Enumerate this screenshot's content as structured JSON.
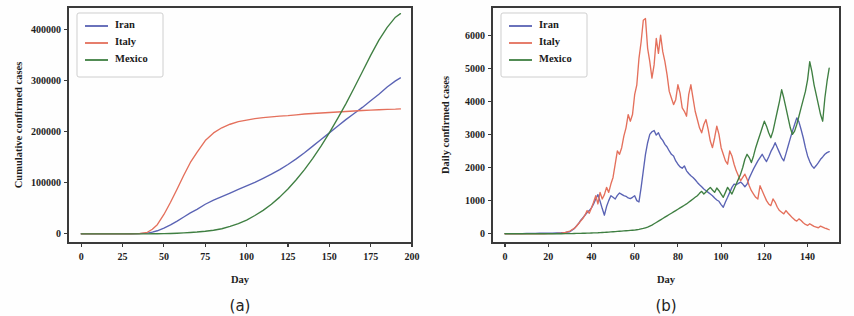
{
  "figure": {
    "background": "#fefefe",
    "panels": [
      {
        "id": "a",
        "caption": "(a)",
        "chart_index": 0
      },
      {
        "id": "b",
        "caption": "(b)",
        "chart_index": 1
      }
    ]
  },
  "colors": {
    "iran": "#5a63b4",
    "italy": "#e4705c",
    "mexico": "#3f7f42",
    "axis": "#3a3a3a",
    "text": "#1d1d1d"
  },
  "chart_data": [
    {
      "type": "line",
      "title": "",
      "panel_label": "(a)",
      "xlabel": "Day",
      "ylabel": "Cumulative confirmed cases",
      "xlim": [
        -8,
        200
      ],
      "ylim": [
        -18000,
        445000
      ],
      "xticks": [
        0,
        25,
        50,
        75,
        100,
        125,
        150,
        175,
        200
      ],
      "xtick_labels": [
        "0",
        "25",
        "50",
        "75",
        "100",
        "125",
        "150",
        "175",
        "200"
      ],
      "yticks": [
        0,
        100000,
        200000,
        300000,
        400000
      ],
      "ytick_labels": [
        "0",
        "100000",
        "200000",
        "300000",
        "400000"
      ],
      "grid": false,
      "legend_position": "upper left",
      "legend_entries": [
        "Iran",
        "Italy",
        "Mexico"
      ],
      "x": [
        0,
        5,
        10,
        15,
        20,
        25,
        30,
        35,
        40,
        43,
        46,
        50,
        54,
        58,
        62,
        66,
        70,
        75,
        80,
        85,
        90,
        95,
        100,
        105,
        110,
        115,
        120,
        125,
        130,
        135,
        140,
        145,
        150,
        155,
        160,
        165,
        170,
        175,
        180,
        185,
        190,
        193
      ],
      "series": [
        {
          "name": "Iran",
          "color": "#5a63b4",
          "values": [
            0,
            0,
            0,
            0,
            0,
            0,
            100,
            300,
            1500,
            3500,
            6000,
            11000,
            17500,
            25000,
            33000,
            41000,
            48000,
            58000,
            66000,
            73000,
            80000,
            87000,
            94000,
            101000,
            109000,
            117000,
            126000,
            136000,
            147000,
            159000,
            172000,
            185000,
            198000,
            211000,
            224000,
            236000,
            248000,
            261000,
            274000,
            288000,
            300000,
            306000
          ]
        },
        {
          "name": "Italy",
          "color": "#e4705c",
          "values": [
            0,
            0,
            0,
            0,
            0,
            0,
            50,
            400,
            3000,
            9000,
            18000,
            38000,
            62000,
            88000,
            115000,
            140000,
            160000,
            183000,
            198000,
            208000,
            215000,
            220000,
            223000,
            226000,
            228000,
            229500,
            231000,
            232000,
            233500,
            235000,
            236000,
            237000,
            238000,
            239000,
            240000,
            241000,
            242000,
            242800,
            243500,
            244000,
            244500,
            245000
          ]
        },
        {
          "name": "Mexico",
          "color": "#3f7f42",
          "values": [
            0,
            0,
            0,
            0,
            0,
            0,
            0,
            0,
            50,
            100,
            200,
            400,
            700,
            1200,
            1800,
            2600,
            3500,
            5000,
            7000,
            10000,
            14500,
            20000,
            27000,
            36000,
            46000,
            58000,
            72000,
            88000,
            106000,
            126000,
            148000,
            172000,
            198000,
            226000,
            255000,
            286000,
            318000,
            350000,
            380000,
            405000,
            425000,
            432000
          ]
        }
      ]
    },
    {
      "type": "line",
      "title": "",
      "panel_label": "(b)",
      "xlabel": "Day",
      "ylabel": "Daily confirmed cases",
      "xlim": [
        -6,
        155
      ],
      "ylim": [
        -280,
        6850
      ],
      "xticks": [
        0,
        20,
        40,
        60,
        80,
        100,
        120,
        140
      ],
      "xtick_labels": [
        "0",
        "20",
        "40",
        "60",
        "80",
        "100",
        "120",
        "140"
      ],
      "yticks": [
        0,
        1000,
        2000,
        3000,
        4000,
        5000,
        6000
      ],
      "ytick_labels": [
        "0",
        "1000",
        "2000",
        "3000",
        "4000",
        "5000",
        "6000"
      ],
      "grid": false,
      "legend_position": "upper left",
      "legend_entries": [
        "Iran",
        "Italy",
        "Mexico"
      ],
      "x": [
        0,
        2,
        4,
        6,
        8,
        10,
        12,
        14,
        16,
        18,
        20,
        22,
        24,
        26,
        28,
        30,
        31,
        32,
        33,
        34,
        35,
        36,
        37,
        38,
        39,
        40,
        41,
        42,
        43,
        44,
        45,
        46,
        47,
        48,
        49,
        50,
        51,
        52,
        53,
        54,
        55,
        56,
        57,
        58,
        59,
        60,
        61,
        62,
        63,
        64,
        65,
        66,
        67,
        68,
        69,
        70,
        71,
        72,
        73,
        74,
        75,
        76,
        77,
        78,
        79,
        80,
        81,
        82,
        83,
        84,
        85,
        86,
        87,
        88,
        89,
        90,
        91,
        92,
        93,
        94,
        95,
        96,
        97,
        98,
        99,
        100,
        101,
        102,
        103,
        104,
        105,
        106,
        107,
        108,
        109,
        110,
        111,
        112,
        113,
        114,
        115,
        116,
        117,
        118,
        119,
        120,
        121,
        122,
        123,
        124,
        125,
        126,
        127,
        128,
        129,
        130,
        131,
        132,
        133,
        134,
        135,
        136,
        137,
        138,
        139,
        140,
        141,
        142,
        143,
        144,
        145,
        146,
        147,
        148,
        149,
        150
      ],
      "series": [
        {
          "name": "Iran",
          "color": "#5a63b4",
          "values": [
            5,
            5,
            5,
            5,
            5,
            10,
            10,
            10,
            15,
            15,
            20,
            20,
            25,
            30,
            40,
            60,
            110,
            150,
            230,
            300,
            400,
            480,
            560,
            640,
            700,
            780,
            900,
            1050,
            1180,
            980,
            760,
            560,
            820,
            1000,
            1150,
            1100,
            1050,
            1160,
            1230,
            1190,
            1150,
            1130,
            1080,
            1060,
            1100,
            1150,
            1000,
            960,
            1400,
            1900,
            2400,
            2750,
            3000,
            3080,
            3120,
            2980,
            3050,
            2900,
            2820,
            2700,
            2620,
            2500,
            2400,
            2350,
            2200,
            2100,
            2020,
            1980,
            2050,
            1900,
            1820,
            1750,
            1700,
            1630,
            1550,
            1480,
            1420,
            1350,
            1300,
            1250,
            1200,
            1150,
            1080,
            1020,
            980,
            880,
            800,
            960,
            1100,
            1250,
            1400,
            1500,
            1480,
            1520,
            1560,
            1500,
            1420,
            1500,
            1680,
            1820,
            1960,
            2080,
            2200,
            2300,
            2400,
            2280,
            2180,
            2320,
            2480,
            2600,
            2750,
            2600,
            2450,
            2300,
            2200,
            2420,
            2650,
            2880,
            3100,
            3300,
            3500,
            3380,
            3150,
            2900,
            2600,
            2350,
            2180,
            2050,
            1980,
            2060,
            2150,
            2250,
            2320,
            2400,
            2450,
            2480,
            2500,
            2350,
            2480
          ]
        },
        {
          "name": "Italy",
          "color": "#e4705c",
          "values": [
            0,
            0,
            0,
            0,
            0,
            0,
            0,
            0,
            0,
            0,
            5,
            5,
            10,
            20,
            40,
            80,
            120,
            160,
            220,
            300,
            380,
            460,
            560,
            700,
            620,
            780,
            950,
            1150,
            900,
            1250,
            1050,
            1180,
            1400,
            1250,
            1500,
            1700,
            2100,
            2500,
            2400,
            2600,
            2950,
            3200,
            3600,
            3400,
            3600,
            4200,
            4500,
            5300,
            5800,
            6450,
            6500,
            5600,
            5200,
            4700,
            5100,
            5900,
            5450,
            6000,
            5500,
            5200,
            4800,
            4300,
            4100,
            3900,
            4050,
            4500,
            4250,
            3800,
            3700,
            3550,
            4200,
            4500,
            4100,
            3700,
            3450,
            3200,
            3050,
            3300,
            3450,
            3150,
            2800,
            2600,
            2900,
            3250,
            3000,
            2600,
            2400,
            2200,
            2100,
            2500,
            2350,
            2100,
            1900,
            1750,
            1600,
            1700,
            1800,
            1650,
            1450,
            1300,
            1200,
            1100,
            1050,
            1450,
            1300,
            1150,
            1000,
            900,
            850,
            1050,
            950,
            800,
            700,
            650,
            600,
            700,
            620,
            550,
            480,
            420,
            380,
            450,
            400,
            330,
            280,
            250,
            300,
            260,
            220,
            200,
            180,
            230,
            200,
            170,
            150,
            120,
            90,
            160,
            180,
            150
          ]
        },
        {
          "name": "Mexico",
          "color": "#3f7f42",
          "values": [
            0,
            0,
            0,
            0,
            0,
            0,
            0,
            0,
            0,
            0,
            0,
            0,
            0,
            0,
            5,
            5,
            5,
            8,
            10,
            10,
            12,
            15,
            15,
            18,
            20,
            22,
            25,
            28,
            30,
            35,
            38,
            40,
            45,
            50,
            55,
            60,
            65,
            70,
            75,
            80,
            85,
            90,
            95,
            100,
            105,
            110,
            120,
            130,
            145,
            160,
            180,
            200,
            230,
            260,
            300,
            340,
            380,
            420,
            460,
            500,
            540,
            580,
            620,
            660,
            700,
            740,
            780,
            820,
            860,
            900,
            950,
            1000,
            1050,
            1100,
            1150,
            1220,
            1280,
            1200,
            1260,
            1340,
            1400,
            1320,
            1250,
            1380,
            1300,
            1200,
            1100,
            1250,
            1400,
            1300,
            1200,
            1350,
            1500,
            1650,
            1800,
            2000,
            2250,
            2400,
            2300,
            2150,
            2350,
            2600,
            2800,
            3000,
            3200,
            3400,
            3250,
            3050,
            2900,
            3100,
            3400,
            3700,
            4000,
            4350,
            4100,
            3800,
            3500,
            3200,
            3000,
            3100,
            3300,
            3550,
            3800,
            4050,
            4300,
            4650,
            5200,
            4900,
            4500,
            4200,
            3900,
            3600,
            3400,
            4100,
            4600,
            5000,
            5350,
            5600,
            5250,
            4850,
            5150,
            4500
          ]
        }
      ]
    }
  ]
}
